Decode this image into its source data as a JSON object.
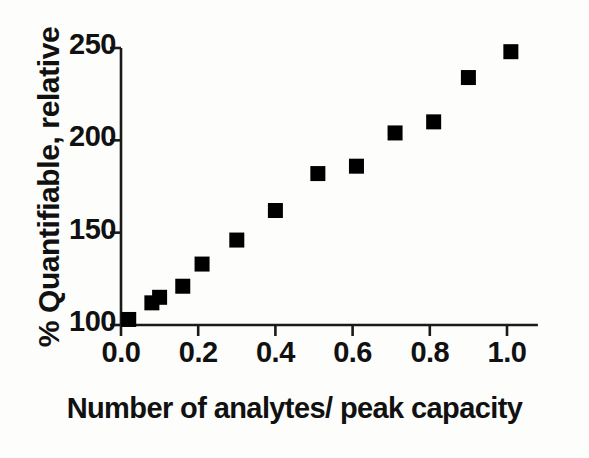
{
  "chart_data": {
    "type": "scatter",
    "title": "",
    "xlabel": "Number of analytes/ peak capacity",
    "ylabel": "% Quantifiable, relative",
    "xlim": [
      0.0,
      1.08
    ],
    "ylim": [
      95,
      255
    ],
    "xticks": [
      0.0,
      0.2,
      0.4,
      0.6,
      0.8,
      1.0
    ],
    "xtick_labels": [
      "0.0",
      "0.2",
      "0.4",
      "0.6",
      "0.8",
      "1.0"
    ],
    "yticks": [
      100,
      150,
      200,
      250
    ],
    "ytick_labels": [
      "100",
      "150",
      "200",
      "250"
    ],
    "grid": false,
    "legend": null,
    "marker": "square",
    "marker_color": "#000000",
    "marker_size_px": 15,
    "axis_color": "#1a1a1a",
    "background_color": "#fdfdfb",
    "series": [
      {
        "name": "% Quantifiable, relative",
        "x": [
          0.02,
          0.08,
          0.1,
          0.16,
          0.21,
          0.3,
          0.4,
          0.51,
          0.61,
          0.71,
          0.81,
          0.9,
          1.01
        ],
        "y": [
          103,
          112,
          115,
          121,
          133,
          146,
          162,
          182,
          186,
          204,
          210,
          234,
          248
        ]
      }
    ]
  }
}
